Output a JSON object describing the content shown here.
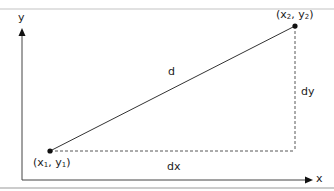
{
  "diagram": {
    "axes": {
      "x_label": "x",
      "y_label": "y"
    },
    "points": [
      {
        "id": "p1",
        "label_x": "x",
        "label_x_sub": "1",
        "label_y": "y",
        "label_y_sub": "1",
        "label": "(x1, y1)"
      },
      {
        "id": "p2",
        "label_x": "x",
        "label_x_sub": "2",
        "label_y": "y",
        "label_y_sub": "2",
        "label": "(x2, y2)"
      }
    ],
    "segments": {
      "distance_label": "d",
      "dx_label": "dx",
      "dy_label": "dy"
    },
    "colors": {
      "frame": "#bdbdbd",
      "ink": "#222222",
      "dashed": "#444444"
    }
  }
}
